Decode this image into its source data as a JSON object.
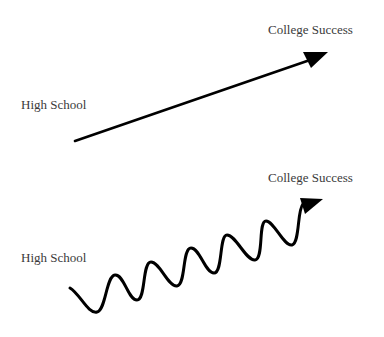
{
  "diagram": {
    "top": {
      "start_label": "High School",
      "end_label": "College Success",
      "path_type": "straight-arrow"
    },
    "bottom": {
      "start_label": "High School",
      "end_label": "College Success",
      "path_type": "wavy-arrow"
    },
    "colors": {
      "stroke": "#000000",
      "text": "#3a3a3a",
      "background": "#ffffff"
    }
  }
}
